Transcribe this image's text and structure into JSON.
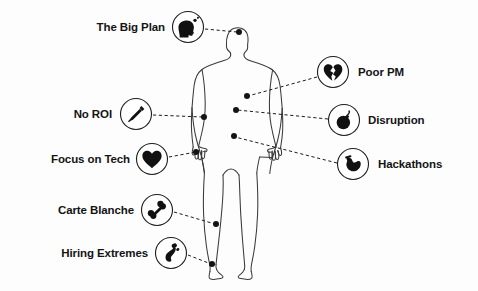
{
  "diagram": {
    "background_color": "#fdfdfd",
    "stroke_color": "#3a3a3a",
    "icon_color": "#111111",
    "body_figure": "human-body-outline"
  },
  "callouts": [
    {
      "id": "the-big-plan",
      "label": "The Big Plan",
      "icon": "head-profile-icon",
      "side": "left",
      "label_x": 165,
      "label_y": 28,
      "badge_x": 188,
      "badge_y": 27,
      "badge_r": 16,
      "anchor_x": 239,
      "anchor_y": 32
    },
    {
      "id": "no-roi",
      "label": "No ROI",
      "icon": "syringe-icon",
      "side": "left",
      "label_x": 112,
      "label_y": 115,
      "badge_x": 136,
      "badge_y": 114,
      "badge_r": 16,
      "anchor_x": 204,
      "anchor_y": 117
    },
    {
      "id": "focus-on-tech",
      "label": "Focus on Tech",
      "icon": "heart-icon",
      "side": "left",
      "label_x": 130,
      "label_y": 160,
      "badge_x": 152,
      "badge_y": 159,
      "badge_r": 16,
      "anchor_x": 196,
      "anchor_y": 152
    },
    {
      "id": "carte-blanche",
      "label": "Carte Blanche",
      "icon": "bone-icon",
      "side": "left",
      "label_x": 134,
      "label_y": 211,
      "badge_x": 157,
      "badge_y": 210,
      "badge_r": 16,
      "anchor_x": 216,
      "anchor_y": 224
    },
    {
      "id": "hiring-extremes",
      "label": "Hiring Extremes",
      "icon": "footprint-icon",
      "side": "left",
      "label_x": 148,
      "label_y": 254,
      "badge_x": 171,
      "badge_y": 253,
      "badge_r": 16,
      "anchor_x": 212,
      "anchor_y": 264
    },
    {
      "id": "poor-pm",
      "label": "Poor PM",
      "icon": "broken-heart-icon",
      "side": "right",
      "label_x": 358,
      "label_y": 73,
      "badge_x": 333,
      "badge_y": 72,
      "badge_r": 16,
      "anchor_x": 247,
      "anchor_y": 96
    },
    {
      "id": "disruption",
      "label": "Disruption",
      "icon": "bomb-icon",
      "side": "right",
      "label_x": 368,
      "label_y": 121,
      "badge_x": 344,
      "badge_y": 120,
      "badge_r": 16,
      "anchor_x": 236,
      "anchor_y": 110
    },
    {
      "id": "hackathons",
      "label": "Hackathons",
      "icon": "stomach-icon",
      "side": "right",
      "label_x": 378,
      "label_y": 165,
      "badge_x": 353,
      "badge_y": 164,
      "badge_r": 16,
      "anchor_x": 234,
      "anchor_y": 136
    }
  ]
}
